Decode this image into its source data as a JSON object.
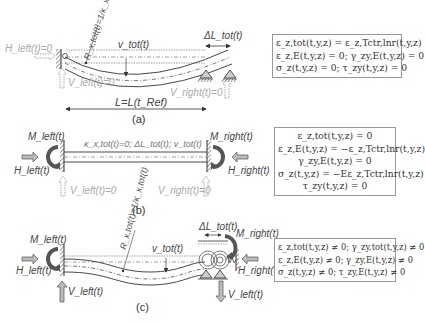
{
  "panels": [
    {
      "id": "a",
      "label": "(a)",
      "left_force": "H_left(t)=0",
      "left_vertical": "V_left(t)=0",
      "right_vertical": "V_right(t)=0",
      "radius": "R_x,tot(t)=1/κ_x,tot(t)",
      "radius_top": "R",
      "radius_bottom": "1/κ",
      "deflection": "v_tot(t)",
      "elongation": "ΔL_tot(t)",
      "length": "L=L(t_Ref)",
      "equations": [
        "ε_z,tot(t,y,z) = ε_z,Tctr,lnr(t,y,z)",
        "ε_z,E(t,y,z) = 0; γ_zy,E(t,y,z) = 0",
        "σ_z(t,y,z) = 0; τ_zy(t,y,z) = 0"
      ]
    },
    {
      "id": "b",
      "label": "(b)",
      "left_moment": "M_left(t)",
      "left_force": "H_left(t)",
      "left_vertical": "V_left(t)=0",
      "right_moment": "M_right(t)",
      "right_force": "H_right(t)",
      "right_vertical": "V_right(t)=0",
      "beam_state": "κ_x,tot(t)=0; ΔL_tot(t); v_tot(t)",
      "equations": [
        "ε_z,tot(t,y,z) = 0",
        "ε_z,E(t,y,z) = −ε_z,Tctr,lnr(t,y,z)",
        "γ_zy,E(t,y,z) = 0",
        "σ_z(t,y,z) = −Eε_z,Tctr,lnr(t,y,z)",
        "τ_zy(t,y,z) = 0"
      ]
    },
    {
      "id": "c",
      "label": "(c)",
      "left_moment": "M_left(t)",
      "left_force": "H_left(t)",
      "left_vertical": "V_left(t)",
      "right_moment": "M_right(t)",
      "right_force": "H_right(t)",
      "right_vertical": "V_left(t)",
      "radius": "R_x,tot(t)=1/κ_x,tot(t)",
      "deflection": "v_tot(t)",
      "elongation": "ΔL_tot(t)",
      "equations": [
        "ε_z,tot(t,y,z) ≠ 0; γ_zy,tot(t,y,z) ≠ 0",
        "ε_z,E(t,y,z) ≠ 0; γ_zy,E(t,y,z) ≠ 0",
        "σ_z(t,y,z) ≠ 0; τ_zy,E(t,y,z) ≠ 0"
      ]
    }
  ],
  "colors": {
    "ink": "#333333",
    "grey_reaction": "#aaaaaa",
    "arrow_fill": "#bbbbbb",
    "box_border": "#999999"
  }
}
